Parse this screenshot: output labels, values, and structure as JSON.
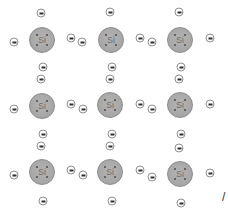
{
  "diagram": {
    "atom_label": "Si",
    "colors": {
      "atom_fill": "#a8a8a8",
      "atom_border": "#8a8a8a",
      "atom_dots": "#4a4a4a",
      "electron_fill": "#ffffff",
      "electron_border": "#8f8f8f",
      "electron_bar": "#2e2e2e"
    },
    "atoms": [
      {
        "row": 1,
        "col": 1,
        "label": "Si",
        "x": 42,
        "y": 40
      },
      {
        "row": 1,
        "col": 2,
        "label": "Si",
        "x": 111,
        "y": 40
      },
      {
        "row": 1,
        "col": 3,
        "label": "Si",
        "x": 180,
        "y": 40
      },
      {
        "row": 2,
        "col": 1,
        "label": "Si",
        "x": 42,
        "y": 106
      },
      {
        "row": 2,
        "col": 2,
        "label": "Si",
        "x": 110,
        "y": 105
      },
      {
        "row": 2,
        "col": 3,
        "label": "Si",
        "x": 180,
        "y": 105
      },
      {
        "row": 3,
        "col": 1,
        "label": "Si",
        "x": 42,
        "y": 172
      },
      {
        "row": 3,
        "col": 2,
        "label": "Si",
        "x": 110,
        "y": 172
      },
      {
        "row": 3,
        "col": 3,
        "label": "Si",
        "x": 180,
        "y": 174
      }
    ],
    "electrons": [
      {
        "x": 41,
        "y": 13
      },
      {
        "x": 110,
        "y": 12
      },
      {
        "x": 179,
        "y": 12
      },
      {
        "x": 14,
        "y": 42
      },
      {
        "x": 71,
        "y": 38
      },
      {
        "x": 82,
        "y": 42
      },
      {
        "x": 140,
        "y": 38
      },
      {
        "x": 152,
        "y": 42
      },
      {
        "x": 210,
        "y": 38
      },
      {
        "x": 43,
        "y": 67
      },
      {
        "x": 41,
        "y": 79
      },
      {
        "x": 112,
        "y": 67
      },
      {
        "x": 110,
        "y": 79
      },
      {
        "x": 181,
        "y": 67
      },
      {
        "x": 179,
        "y": 79
      },
      {
        "x": 14,
        "y": 109
      },
      {
        "x": 71,
        "y": 104
      },
      {
        "x": 83,
        "y": 109
      },
      {
        "x": 140,
        "y": 104
      },
      {
        "x": 152,
        "y": 109
      },
      {
        "x": 210,
        "y": 104
      },
      {
        "x": 43,
        "y": 134
      },
      {
        "x": 41,
        "y": 146
      },
      {
        "x": 112,
        "y": 134
      },
      {
        "x": 110,
        "y": 146
      },
      {
        "x": 181,
        "y": 134
      },
      {
        "x": 179,
        "y": 148
      },
      {
        "x": 14,
        "y": 175
      },
      {
        "x": 71,
        "y": 170
      },
      {
        "x": 83,
        "y": 175
      },
      {
        "x": 140,
        "y": 170
      },
      {
        "x": 152,
        "y": 177
      },
      {
        "x": 210,
        "y": 173
      },
      {
        "x": 43,
        "y": 201
      },
      {
        "x": 112,
        "y": 201
      },
      {
        "x": 181,
        "y": 203
      }
    ],
    "edge_glyph": "/"
  }
}
